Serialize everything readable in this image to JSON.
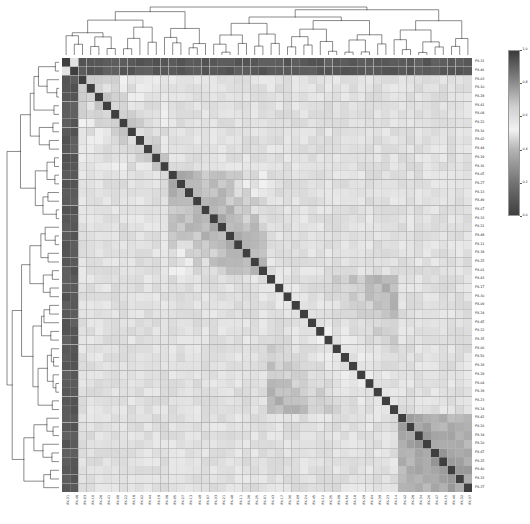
{
  "figure": {
    "type": "clustermap",
    "title": "",
    "background_color": "#ffffff"
  },
  "chart_data": {
    "type": "heatmap",
    "title": "",
    "subtitle": "",
    "xlabel": "",
    "ylabel": "",
    "matrix_shape": [
      50,
      50
    ],
    "symmetric": true,
    "grid": true,
    "gridline_color": "#b0b0b0",
    "legend_position": "right",
    "colormap": {
      "name": "diverging-gray",
      "reversed": true,
      "stops": [
        {
          "pos": 0.0,
          "color": "#3f3f3f"
        },
        {
          "pos": 0.18,
          "color": "#6e6e6e"
        },
        {
          "pos": 0.4,
          "color": "#b4b4b4"
        },
        {
          "pos": 0.52,
          "color": "#f2f2f2"
        },
        {
          "pos": 0.66,
          "color": "#cfcfcf"
        },
        {
          "pos": 0.84,
          "color": "#7d7d7d"
        },
        {
          "pos": 1.0,
          "color": "#3a3a3a"
        }
      ]
    },
    "colorbar": {
      "vmin": 0.0,
      "vmax": 1.0,
      "orientation": "vertical",
      "ticks": [
        {
          "value": 1.0,
          "label": "1.0"
        },
        {
          "value": 0.8,
          "label": "0.8"
        },
        {
          "value": 0.6,
          "label": "0.6"
        },
        {
          "value": 0.4,
          "label": "0.4"
        },
        {
          "value": 0.2,
          "label": "0.2"
        },
        {
          "value": 0.0,
          "label": "0.0"
        }
      ]
    },
    "xtick_labels": [
      "PX-31",
      "PX-46",
      "PX-03",
      "PX-10",
      "PX-28",
      "PX-41",
      "PX-08",
      "PX-22",
      "PX-16",
      "PX-02",
      "PX-44",
      "PX-19",
      "PX-36",
      "PX-05",
      "PX-27",
      "PX-13",
      "PX-49",
      "PX-07",
      "PX-33",
      "PX-21",
      "PX-48",
      "PX-11",
      "PX-38",
      "PX-25",
      "PX-01",
      "PX-43",
      "PX-17",
      "PX-30",
      "PX-09",
      "PX-24",
      "PX-45",
      "PX-12",
      "PX-35",
      "PX-06",
      "PX-50",
      "PX-18",
      "PX-29",
      "PX-04",
      "PX-39",
      "PX-23",
      "PX-14",
      "PX-42",
      "PX-26",
      "PX-34",
      "PX-20",
      "PX-47",
      "PX-15",
      "PX-40",
      "PX-32",
      "PX-37"
    ],
    "ytick_labels": [
      "PX-31",
      "PX-46",
      "PX-03",
      "PX-10",
      "PX-28",
      "PX-41",
      "PX-08",
      "PX-22",
      "PX-16",
      "PX-02",
      "PX-44",
      "PX-19",
      "PX-36",
      "PX-05",
      "PX-27",
      "PX-13",
      "PX-49",
      "PX-07",
      "PX-33",
      "PX-21",
      "PX-48",
      "PX-11",
      "PX-38",
      "PX-25",
      "PX-01",
      "PX-43",
      "PX-17",
      "PX-30",
      "PX-09",
      "PX-24",
      "PX-45",
      "PX-12",
      "PX-35",
      "PX-06",
      "PX-50",
      "PX-18",
      "PX-29",
      "PX-04",
      "PX-39",
      "PX-23",
      "PX-14",
      "PX-42",
      "PX-26",
      "PX-34",
      "PX-20",
      "PX-47",
      "PX-15",
      "PX-40",
      "PX-32",
      "PX-37"
    ],
    "cluster_blocks": [
      {
        "name": "outlier-band",
        "rows": [
          0,
          1
        ],
        "cols": [
          0,
          49
        ],
        "mean_value": 0.07
      },
      {
        "name": "cluster-A",
        "rows": [
          2,
          12
        ],
        "cols": [
          2,
          12
        ],
        "mean_value": 0.44
      },
      {
        "name": "cluster-B",
        "rows": [
          10,
          24
        ],
        "cols": [
          10,
          24
        ],
        "mean_value": 0.38
      },
      {
        "name": "cluster-C",
        "rows": [
          25,
          40
        ],
        "cols": [
          25,
          40
        ],
        "mean_value": 0.55
      },
      {
        "name": "cluster-D",
        "rows": [
          41,
          49
        ],
        "cols": [
          41,
          49
        ],
        "mean_value": 0.33
      }
    ],
    "diagonal_value": 0.0,
    "background_value": 0.55
  },
  "row_dendrogram": {
    "orientation": "left",
    "line_color": "#2a2a2a",
    "n_leaves": 50
  },
  "col_dendrogram": {
    "orientation": "top",
    "line_color": "#2a2a2a",
    "n_leaves": 50
  },
  "layout": {
    "heatmap": {
      "x": 62,
      "y": 58,
      "w": 410,
      "h": 434
    },
    "col_dendrogram": {
      "x": 62,
      "y": 5,
      "w": 410,
      "h": 50
    },
    "row_dendrogram": {
      "x": 5,
      "y": 58,
      "w": 54,
      "h": 434
    },
    "row_labels": {
      "x": 475,
      "y": 58
    },
    "col_labels": {
      "x": 62,
      "y": 495
    },
    "colorbar": {
      "x": 508,
      "y": 50,
      "w": 12,
      "h": 166
    }
  }
}
